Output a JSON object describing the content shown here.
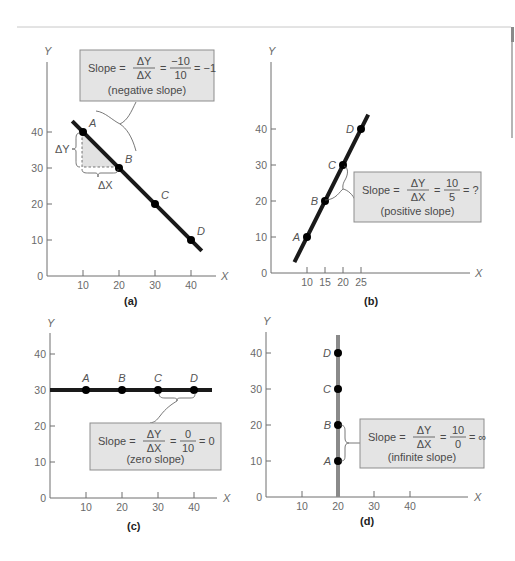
{
  "page": {
    "decor": {
      "rule_color": "#c8c8c8",
      "side_bar_color": "#9a9a9a"
    }
  },
  "colors": {
    "line": "#1a1a1a",
    "vertical_line": "#8a8a8a",
    "box_fill": "#e4e4e4",
    "box_border": "#8d8d8d",
    "axis": "#6f6f6f",
    "text": "#4a4a4a"
  },
  "chart_data": [
    {
      "id": "a",
      "type": "line",
      "caption": "(a)",
      "xlabel": "X",
      "ylabel": "Y",
      "xlim": [
        0,
        45
      ],
      "ylim": [
        0,
        45
      ],
      "x_ticks": [
        10,
        20,
        30,
        40
      ],
      "y_ticks": [
        0,
        10,
        20,
        30,
        40
      ],
      "points": [
        {
          "label": "A",
          "x": 10,
          "y": 40
        },
        {
          "label": "B",
          "x": 20,
          "y": 30
        },
        {
          "label": "C",
          "x": 30,
          "y": 20
        },
        {
          "label": "D",
          "x": 40,
          "y": 10
        }
      ],
      "line_extent_x": [
        7,
        43
      ],
      "delta_labels": {
        "dy": "ΔY",
        "dx": "ΔX"
      },
      "annotation": {
        "prefix": "Slope =",
        "num": "ΔY",
        "den": "ΔX",
        "eq": "=",
        "value_num": "−10",
        "value_den": "10",
        "result": "= −1",
        "note": "(negative slope)"
      },
      "slope": -1
    },
    {
      "id": "b",
      "type": "line",
      "caption": "(b)",
      "xlabel": "X",
      "ylabel": "Y",
      "xlim": [
        0,
        55
      ],
      "ylim": [
        0,
        45
      ],
      "x_ticks": [
        10,
        15,
        20,
        25
      ],
      "y_ticks": [
        0,
        10,
        20,
        30,
        40
      ],
      "points": [
        {
          "label": "A",
          "x": 10,
          "y": 10
        },
        {
          "label": "B",
          "x": 15,
          "y": 20
        },
        {
          "label": "C",
          "x": 20,
          "y": 30
        },
        {
          "label": "D",
          "x": 25,
          "y": 40
        }
      ],
      "line_extent_x": [
        6.5,
        27
      ],
      "annotation": {
        "prefix": "Slope =",
        "num": "ΔY",
        "den": "ΔX",
        "eq": "=",
        "value_num": "10",
        "value_den": "5",
        "result": "= ?",
        "note": "(positive slope)"
      },
      "slope": 2
    },
    {
      "id": "c",
      "type": "line",
      "caption": "(c)",
      "xlabel": "X",
      "ylabel": "Y",
      "xlim": [
        0,
        45
      ],
      "ylim": [
        0,
        45
      ],
      "x_ticks": [
        10,
        20,
        30,
        40
      ],
      "y_ticks": [
        0,
        10,
        20,
        30,
        40
      ],
      "points": [
        {
          "label": "A",
          "x": 10,
          "y": 30
        },
        {
          "label": "B",
          "x": 20,
          "y": 30
        },
        {
          "label": "C",
          "x": 30,
          "y": 30
        },
        {
          "label": "D",
          "x": 40,
          "y": 30
        }
      ],
      "line_extent_x": [
        0,
        45
      ],
      "annotation": {
        "prefix": "Slope =",
        "num": "ΔY",
        "den": "ΔX",
        "eq": "=",
        "value_num": "0",
        "value_den": "10",
        "result": "= 0",
        "note": "(zero slope)"
      },
      "slope": 0
    },
    {
      "id": "d",
      "type": "line",
      "caption": "(d)",
      "xlabel": "X",
      "ylabel": "Y",
      "xlim": [
        0,
        55
      ],
      "ylim": [
        0,
        45
      ],
      "x_ticks": [
        10,
        20,
        30,
        40
      ],
      "y_ticks": [
        0,
        10,
        20,
        30,
        40
      ],
      "points": [
        {
          "label": "A",
          "x": 20,
          "y": 10
        },
        {
          "label": "B",
          "x": 20,
          "y": 20
        },
        {
          "label": "C",
          "x": 20,
          "y": 30
        },
        {
          "label": "D",
          "x": 20,
          "y": 40
        }
      ],
      "line_extent_y": [
        0,
        45
      ],
      "annotation": {
        "prefix": "Slope =",
        "num": "ΔY",
        "den": "ΔX",
        "eq": "=",
        "value_num": "10",
        "value_den": "0",
        "result": "= ∞",
        "note": "(infinite slope)"
      },
      "slope": "infinite"
    }
  ]
}
